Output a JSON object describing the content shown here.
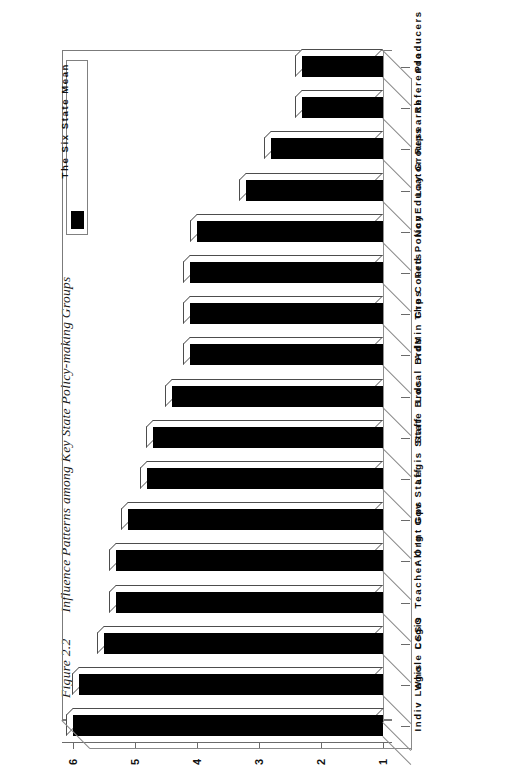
{
  "figure": {
    "number": "Figure 2.2",
    "caption": "Influence Patterns among Key State Policy-making Groups"
  },
  "legend": {
    "title": "The Six State Mean",
    "swatch_color": "#000000",
    "position": "top-left"
  },
  "axis": {
    "value_ticks": [
      "6",
      "5",
      "4",
      "3",
      "2",
      "1"
    ],
    "value_min": 1,
    "value_max": 6,
    "direction": "right-to-left"
  },
  "chart_data": {
    "type": "bar",
    "orientation": "horizontal-3d",
    "title": "Influence Patterns among Key State Policy-making Groups",
    "xlabel": "",
    "ylabel": "",
    "xlim": [
      1,
      6
    ],
    "grid": false,
    "legend_position": "top-left",
    "series": [
      {
        "name": "The Six State Mean",
        "color": "#000000",
        "values": [
          2.3,
          2.3,
          2.8,
          3.2,
          4.0,
          4.1,
          4.1,
          4.1,
          4.4,
          4.7,
          4.8,
          5.1,
          5.3,
          5.3,
          5.5,
          5.9,
          6.0
        ]
      }
    ],
    "categories": [
      "Producers",
      "Referenda",
      "Research",
      "Lay Groups",
      "NonEducator",
      "Fed Policy",
      "The Courts",
      "AdMin Grps",
      "Local Brds",
      "State Brds",
      "Legis Staff",
      "Gov Staff",
      "All Int Gps",
      "Teacher Org",
      "CSSO",
      "Whole Legis",
      "Indiv Legis"
    ]
  }
}
